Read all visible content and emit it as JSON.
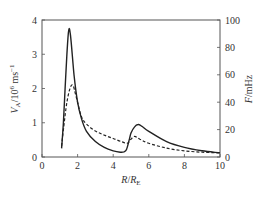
{
  "chart_data": {
    "type": "line",
    "title": "",
    "xlabel": "R/R_E",
    "ylabel_left": "V_A/10^6 ms^-1",
    "ylabel_right": "F/mHz",
    "xlim": [
      0,
      10
    ],
    "ylim_left": [
      0,
      4
    ],
    "ylim_right": [
      0,
      100
    ],
    "x_ticks": [
      0,
      2,
      4,
      6,
      8,
      10
    ],
    "y_ticks_left": [
      0,
      1,
      2,
      3,
      4
    ],
    "y_ticks_right": [
      0,
      20,
      40,
      60,
      80,
      100
    ],
    "grid": false,
    "legend": "none",
    "series": [
      {
        "name": "V_A (Alfvén speed)",
        "axis": "left",
        "style": "solid",
        "x": [
          1.1,
          1.2,
          1.3,
          1.4,
          1.5,
          1.6,
          1.8,
          2.0,
          2.2,
          2.5,
          3.0,
          3.5,
          4.0,
          4.4,
          4.6,
          4.75,
          4.9,
          5.0,
          5.2,
          5.4,
          5.6,
          6.0,
          7.0,
          8.0,
          9.0,
          10.0
        ],
        "values": [
          0.25,
          1.0,
          2.0,
          3.0,
          3.7,
          3.55,
          2.4,
          1.6,
          1.15,
          0.75,
          0.45,
          0.28,
          0.18,
          0.14,
          0.15,
          0.22,
          0.5,
          0.7,
          0.88,
          0.95,
          0.9,
          0.75,
          0.45,
          0.28,
          0.18,
          0.12
        ]
      },
      {
        "name": "F (frequency)",
        "axis": "right",
        "style": "dashed",
        "x": [
          1.1,
          1.2,
          1.4,
          1.6,
          1.75,
          1.9,
          2.2,
          2.5,
          3.0,
          3.5,
          4.0,
          4.5,
          4.8,
          5.0,
          5.2,
          5.5,
          6.0,
          7.0,
          8.0,
          9.0,
          10.0
        ],
        "values": [
          8,
          20,
          40,
          51,
          52,
          45,
          30,
          24,
          19,
          16,
          13.5,
          11,
          10,
          13,
          15,
          13,
          10,
          6.5,
          4.5,
          3.5,
          3
        ]
      }
    ]
  }
}
